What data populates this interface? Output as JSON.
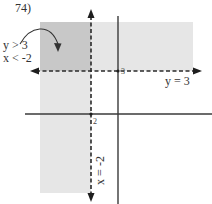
{
  "problem": {
    "number_label": "74)"
  },
  "inequalities": {
    "line1": "y > 3",
    "line2": "x < -2"
  },
  "boundary_lines": {
    "horizontal_label": "y = 3",
    "vertical_label": "x = -2"
  },
  "ticks": {
    "y_tick": "3",
    "x_tick": "2"
  },
  "colors": {
    "overlap_shade": "#c8c8c8",
    "single_shade": "#e6e6e6",
    "axis": "#3a3a3a",
    "dashed": "#2a2a2a"
  }
}
